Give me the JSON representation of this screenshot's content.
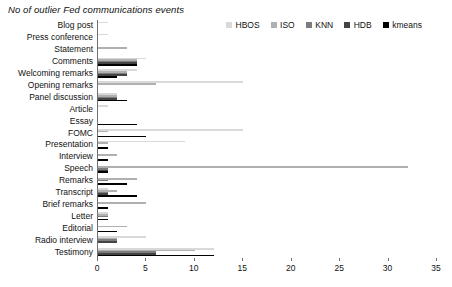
{
  "chart": {
    "title": "No of outlier Fed communications events",
    "type": "bar"
  },
  "legend": {
    "position": "top-right",
    "items": [
      {
        "label": "HBOS",
        "color": "#d9d9d9"
      },
      {
        "label": "ISO",
        "color": "#b0b0b0"
      },
      {
        "label": "KNN",
        "color": "#7d7d7d"
      },
      {
        "label": "HDB",
        "color": "#444444"
      },
      {
        "label": "kmeans",
        "color": "#000000"
      }
    ]
  },
  "axis": {
    "x": {
      "ticks": [
        "0",
        "5",
        "10",
        "15",
        "20",
        "25",
        "30",
        "35"
      ],
      "min": 0,
      "max": 35
    }
  },
  "chart_data": {
    "type": "bar",
    "orientation": "horizontal",
    "title": "No of outlier Fed communications events",
    "xlabel": "",
    "ylabel": "",
    "xlim": [
      0,
      35
    ],
    "grid": false,
    "legend_position": "top-right",
    "categories": [
      "Blog post",
      "Press conference",
      "Statement",
      "Comments",
      "Welcoming remarks",
      "Opening remarks",
      "Panel discussion",
      "Article",
      "Essay",
      "FOMC",
      "Presentation",
      "Interview",
      "Speech",
      "Remarks",
      "Transcript",
      "Brief remarks",
      "Letter",
      "Editorial",
      "Radio interview",
      "Testimony"
    ],
    "series": [
      {
        "name": "HBOS",
        "color": "#d9d9d9",
        "values": [
          1,
          1,
          0,
          5,
          4,
          15,
          2,
          1,
          0,
          15,
          9,
          0,
          0,
          0,
          1,
          0,
          1,
          0,
          5,
          12
        ]
      },
      {
        "name": "ISO",
        "color": "#b0b0b0",
        "values": [
          0,
          0,
          3,
          4,
          3,
          6,
          2,
          0,
          0,
          1,
          1,
          2,
          32,
          4,
          2,
          5,
          1,
          3,
          2,
          10
        ]
      },
      {
        "name": "KNN",
        "color": "#7d7d7d",
        "values": [
          0,
          0,
          0,
          4,
          3,
          0,
          2,
          0,
          0,
          0,
          0,
          0,
          1,
          1,
          1,
          0,
          1,
          0,
          2,
          6
        ]
      },
      {
        "name": "HDB",
        "color": "#444444",
        "values": [
          0,
          0,
          0,
          4,
          3,
          0,
          2,
          0,
          0,
          0,
          0,
          0,
          1,
          0,
          1,
          0,
          0,
          0,
          2,
          6
        ]
      },
      {
        "name": "kmeans",
        "color": "#000000",
        "values": [
          0,
          0,
          0,
          4,
          2,
          0,
          3,
          0,
          4,
          5,
          1,
          1,
          1,
          3,
          4,
          1,
          1,
          2,
          0,
          12
        ]
      }
    ]
  }
}
